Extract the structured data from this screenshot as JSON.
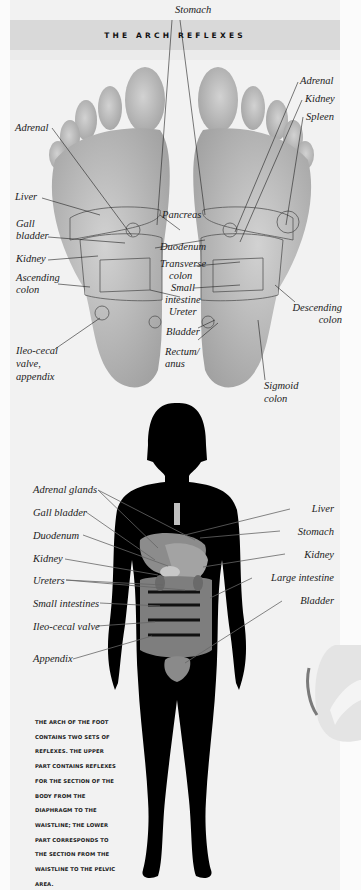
{
  "header": {
    "title": "THE ARCH REFLEXES"
  },
  "foot_labels": {
    "stomach": "Stomach",
    "adrenal_left": "Adrenal",
    "liver": "Liver",
    "gall_bladder_1": "Gall",
    "gall_bladder_2": "bladder",
    "kidney_left": "Kidney",
    "ascending_colon_1": "Ascending",
    "ascending_colon_2": "colon",
    "ileo_cecal_1": "Ileo-cecal",
    "ileo_cecal_2": "valve,",
    "ileo_cecal_3": "appendix",
    "adrenal_right": "Adrenal",
    "kidney_right": "Kidney",
    "spleen": "Spleen",
    "pancreas": "Pancreas",
    "duodenum": "Duodenum",
    "transverse_colon_1": "Transverse",
    "transverse_colon_2": "colon",
    "small_intestine_1": "Small",
    "small_intestine_2": "intestine",
    "ureter": "Ureter",
    "bladder": "Bladder",
    "rectum_1": "Rectum/",
    "rectum_2": "anus",
    "descending_colon_1": "Descending",
    "descending_colon_2": "colon",
    "sigmoid_colon_1": "Sigmoid",
    "sigmoid_colon_2": "colon"
  },
  "body_labels": {
    "left": [
      "Adrenal glands",
      "Gall bladder",
      "Duodenum",
      "Kidney",
      "Ureters",
      "Small intestines",
      "Ileo-cecal valve",
      "Appendix"
    ],
    "right": [
      "Liver",
      "Stomach",
      "Kidney",
      "Large intestine",
      "Bladder"
    ]
  },
  "caption": {
    "lines": [
      "THE ARCH OF THE FOOT",
      "CONTAINS TWO SETS OF",
      "REFLEXES. THE UPPER",
      "PART CONTAINS REFLEXES",
      "FOR THE SECTION OF THE",
      "BODY FROM THE",
      "DIAPHRAGM TO THE",
      "WAISTLINE; THE LOWER",
      "PART CORRESPONDS TO",
      "THE SECTION FROM THE",
      "WAISTLINE TO THE PELVIC",
      "AREA."
    ]
  },
  "colors": {
    "page": "#f2f2f2",
    "header_band": "#d9d9d9",
    "foot": "#bdbdbd",
    "silhouette": "#000000",
    "organs": "#8a8a8a"
  }
}
